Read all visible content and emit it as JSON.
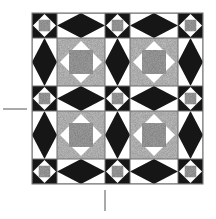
{
  "title": "Quilt block pattern diagram",
  "canvas": {
    "width": 216,
    "height": 219,
    "background": "#ffffff"
  },
  "colors": {
    "black": "#161616",
    "white": "#ffffff",
    "stipple_light": "#c6c6c6",
    "stipple_dark": "#a6a6a6",
    "border": "#6e6e6e",
    "tick": "#555555"
  },
  "grid": {
    "col_edges": [
      32,
      57,
      105,
      130,
      178,
      203
    ],
    "row_edges": [
      13,
      38,
      86,
      111,
      159,
      184
    ]
  },
  "block_types": {
    "small_star": "black square, white on-point diamond, grey center square",
    "h_diamond": "white rectangle with horizontal black diamond",
    "v_diamond": "white rectangle with vertical black diamond",
    "stipple_block": "light stipple square, white on-point diamond, darker stipple center square"
  },
  "layout": [
    [
      "small_star",
      "h_diamond",
      "small_star",
      "h_diamond",
      "small_star"
    ],
    [
      "v_diamond",
      "stipple_block",
      "v_diamond",
      "stipple_block",
      "v_diamond"
    ],
    [
      "small_star",
      "h_diamond",
      "small_star",
      "h_diamond",
      "small_star"
    ],
    [
      "v_diamond",
      "stipple_block",
      "v_diamond",
      "stipple_block",
      "v_diamond"
    ],
    [
      "small_star",
      "h_diamond",
      "small_star",
      "h_diamond",
      "small_star"
    ]
  ],
  "registration_marks": [
    {
      "name": "left-horizontal-tick",
      "x1": 3,
      "y1": 109,
      "x2": 27,
      "y2": 109
    },
    {
      "name": "bottom-vertical-tick",
      "x1": 105,
      "y1": 190,
      "x2": 105,
      "y2": 211
    }
  ]
}
